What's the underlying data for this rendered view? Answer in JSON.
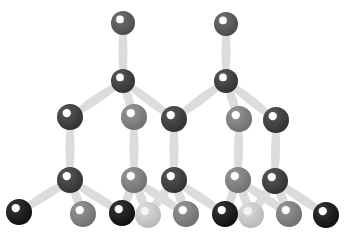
{
  "diagram": {
    "type": "ball-and-stick crystal lattice",
    "background": "#ffffff",
    "bond_color": "#dcdcdc",
    "atom_styles": {
      "top": "#5a5a5a",
      "dark": "#3c3c3c",
      "medium": "#858585",
      "light": "#dadada",
      "black": "#141414"
    },
    "atoms": [
      {
        "id": "t1",
        "x": 123,
        "y": 23,
        "r": 12,
        "style": "top"
      },
      {
        "id": "t2",
        "x": 226,
        "y": 24,
        "r": 12,
        "style": "top"
      },
      {
        "id": "m1",
        "x": 123,
        "y": 81,
        "r": 12,
        "style": "dark"
      },
      {
        "id": "m2",
        "x": 226,
        "y": 81,
        "r": 12,
        "style": "dark"
      },
      {
        "id": "a1",
        "x": 70,
        "y": 117,
        "r": 13,
        "style": "dark"
      },
      {
        "id": "a2",
        "x": 134,
        "y": 117,
        "r": 13,
        "style": "medium"
      },
      {
        "id": "a3",
        "x": 174,
        "y": 119,
        "r": 13,
        "style": "dark"
      },
      {
        "id": "a4",
        "x": 239,
        "y": 119,
        "r": 13,
        "style": "medium"
      },
      {
        "id": "a5",
        "x": 276,
        "y": 120,
        "r": 13,
        "style": "dark"
      },
      {
        "id": "b1",
        "x": 70,
        "y": 180,
        "r": 13,
        "style": "dark"
      },
      {
        "id": "b2",
        "x": 134,
        "y": 180,
        "r": 13,
        "style": "medium"
      },
      {
        "id": "b3",
        "x": 174,
        "y": 180,
        "r": 13,
        "style": "dark"
      },
      {
        "id": "b4",
        "x": 238,
        "y": 180,
        "r": 13,
        "style": "medium"
      },
      {
        "id": "b5",
        "x": 275,
        "y": 181,
        "r": 13,
        "style": "dark"
      },
      {
        "id": "c1",
        "x": 19,
        "y": 212,
        "r": 13,
        "style": "black"
      },
      {
        "id": "c2",
        "x": 83,
        "y": 214,
        "r": 13,
        "style": "medium"
      },
      {
        "id": "c3",
        "x": 122,
        "y": 213,
        "r": 13,
        "style": "black"
      },
      {
        "id": "c4",
        "x": 148,
        "y": 215,
        "r": 13,
        "style": "light"
      },
      {
        "id": "c5",
        "x": 186,
        "y": 214,
        "r": 13,
        "style": "medium"
      },
      {
        "id": "c6",
        "x": 225,
        "y": 214,
        "r": 13,
        "style": "black"
      },
      {
        "id": "c7",
        "x": 251,
        "y": 215,
        "r": 13,
        "style": "light"
      },
      {
        "id": "c8",
        "x": 289,
        "y": 214,
        "r": 13,
        "style": "medium"
      },
      {
        "id": "c9",
        "x": 326,
        "y": 215,
        "r": 13,
        "style": "black"
      }
    ],
    "bonds": [
      [
        "t1",
        "m1"
      ],
      [
        "t2",
        "m2"
      ],
      [
        "m1",
        "a1"
      ],
      [
        "m1",
        "a2"
      ],
      [
        "m1",
        "a3"
      ],
      [
        "m2",
        "a3"
      ],
      [
        "m2",
        "a4"
      ],
      [
        "m2",
        "a5"
      ],
      [
        "a1",
        "b1"
      ],
      [
        "a2",
        "b2"
      ],
      [
        "a3",
        "b3"
      ],
      [
        "a4",
        "b4"
      ],
      [
        "a5",
        "b5"
      ],
      [
        "b1",
        "c1"
      ],
      [
        "b1",
        "c2"
      ],
      [
        "b1",
        "c3"
      ],
      [
        "b2",
        "c3"
      ],
      [
        "b2",
        "c4"
      ],
      [
        "b2",
        "c5"
      ],
      [
        "b3",
        "c4"
      ],
      [
        "b3",
        "c5"
      ],
      [
        "b3",
        "c6"
      ],
      [
        "b4",
        "c6"
      ],
      [
        "b4",
        "c7"
      ],
      [
        "b4",
        "c8"
      ],
      [
        "b5",
        "c7"
      ],
      [
        "b5",
        "c8"
      ],
      [
        "b5",
        "c9"
      ]
    ]
  }
}
